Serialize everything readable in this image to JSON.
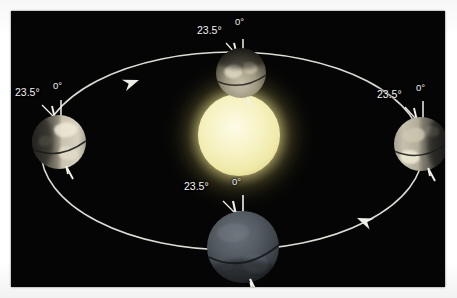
{
  "figure": {
    "background_color": "#050505",
    "page_color": "#ffffff",
    "orbit_color": "#e8e8e4",
    "sun_color": "#f2efb4",
    "sun_glow_color": "#fffbd0"
  },
  "sun": {
    "name": "Sun",
    "cx": 228,
    "cy": 124,
    "r": 41,
    "glow_r": 78
  },
  "orbit": {
    "name": "Earth orbital path",
    "cx": 221,
    "cy": 140,
    "rx": 191,
    "ry": 99,
    "direction": "counterclockwise",
    "arrows": [
      {
        "label": "orbit-direction-arrow-upper-left",
        "x": 127,
        "y": 68,
        "rotation": -160
      },
      {
        "label": "orbit-direction-arrow-lower-right",
        "x": 358,
        "y": 211,
        "rotation": 22
      }
    ]
  },
  "earths": [
    {
      "id": "earth-top",
      "position": "top",
      "cx": 230,
      "cy": 62,
      "r": 25,
      "tilt_label": "23.5°",
      "reference_label": "0°",
      "tilt_degrees": 23.5,
      "lit_side": "bottom",
      "disc_light": "#b9b4a2",
      "disc_dark": "#3a3a38"
    },
    {
      "id": "earth-left",
      "position": "left",
      "cx": 48,
      "cy": 131,
      "r": 27,
      "tilt_label": "23.5°",
      "reference_label": "0°",
      "tilt_degrees": 23.5,
      "lit_side": "right",
      "disc_light": "#cfcabb",
      "disc_dark": "#55524c"
    },
    {
      "id": "earth-right",
      "position": "right",
      "cx": 410,
      "cy": 133,
      "r": 27,
      "tilt_label": "23.5°",
      "reference_label": "0°",
      "tilt_degrees": 23.5,
      "lit_side": "left",
      "disc_light": "#bdb8a8",
      "disc_dark": "#4a4945"
    },
    {
      "id": "earth-bottom",
      "position": "bottom",
      "cx": 232,
      "cy": 236,
      "r": 36,
      "tilt_label": "23.5°",
      "reference_label": "0°",
      "tilt_degrees": 23.5,
      "lit_side": "none",
      "disc_light": "#5a5f66",
      "disc_dark": "#2b3036"
    }
  ],
  "labels": {
    "top": {
      "tilt": "23.5°",
      "tilt_x": 196,
      "tilt_y": 25,
      "ref": "0°",
      "ref_x": 236,
      "ref_y": 18
    },
    "left": {
      "tilt": "23.5°",
      "tilt_x": 14,
      "tilt_y": 86,
      "ref": "0°",
      "ref_x": 53,
      "ref_y": 81
    },
    "right": {
      "tilt": "23.5°",
      "tilt_x": 378,
      "tilt_y": 87,
      "ref": "0°",
      "ref_x": 418,
      "ref_y": 82
    },
    "bottom": {
      "tilt": "23.5°",
      "tilt_x": 184,
      "tilt_y": 180,
      "ref": "0°",
      "ref_x": 231,
      "ref_y": 177
    }
  }
}
